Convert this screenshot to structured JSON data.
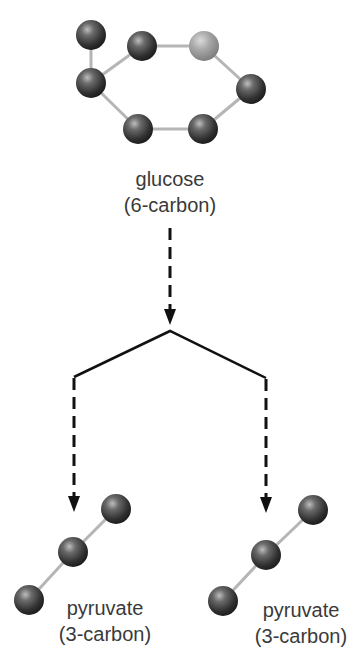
{
  "diagram": {
    "colors": {
      "atom": "#3d3d3d",
      "atom_highlight": "#9a9a9a",
      "bond": "#b5b5b5",
      "arrow": "#111111",
      "text": "#3a3a3a",
      "background": "#ffffff"
    },
    "glucose": {
      "name": "glucose",
      "carbons": "(6-carbon)",
      "atoms": [
        {
          "id": "g1",
          "x": 91,
          "y": 35,
          "highlight": false
        },
        {
          "id": "g2",
          "x": 91,
          "y": 83,
          "highlight": false
        },
        {
          "id": "g3",
          "x": 142,
          "y": 46,
          "highlight": false
        },
        {
          "id": "g4",
          "x": 204,
          "y": 46,
          "highlight": true
        },
        {
          "id": "g5",
          "x": 251,
          "y": 89,
          "highlight": false
        },
        {
          "id": "g6",
          "x": 203,
          "y": 129,
          "highlight": false
        },
        {
          "id": "g7",
          "x": 138,
          "y": 129,
          "highlight": false
        }
      ],
      "bonds": [
        [
          "g1",
          "g2"
        ],
        [
          "g2",
          "g3"
        ],
        [
          "g3",
          "g4"
        ],
        [
          "g4",
          "g5"
        ],
        [
          "g5",
          "g6"
        ],
        [
          "g6",
          "g7"
        ],
        [
          "g7",
          "g2"
        ]
      ]
    },
    "pyruvate_left": {
      "name": "pyruvate",
      "carbons": "(3-carbon)",
      "atoms": [
        {
          "id": "pl1",
          "x": 116,
          "y": 509
        },
        {
          "id": "pl2",
          "x": 73,
          "y": 552
        },
        {
          "id": "pl3",
          "x": 29,
          "y": 600
        }
      ]
    },
    "pyruvate_right": {
      "name": "pyruvate",
      "carbons": "(3-carbon)",
      "atoms": [
        {
          "id": "pr1",
          "x": 313,
          "y": 510
        },
        {
          "id": "pr2",
          "x": 266,
          "y": 555
        },
        {
          "id": "pr3",
          "x": 223,
          "y": 601
        }
      ]
    },
    "arrows": {
      "top_dashed": {
        "x": 170,
        "y1": 228,
        "y2": 325
      },
      "branch": {
        "apex": [
          170,
          331
        ],
        "left": [
          74,
          377
        ],
        "right": [
          266,
          378
        ]
      },
      "left_dashed": {
        "x": 74,
        "y1": 378,
        "y2": 512
      },
      "right_dashed": {
        "x": 266,
        "y1": 379,
        "y2": 513
      }
    }
  }
}
